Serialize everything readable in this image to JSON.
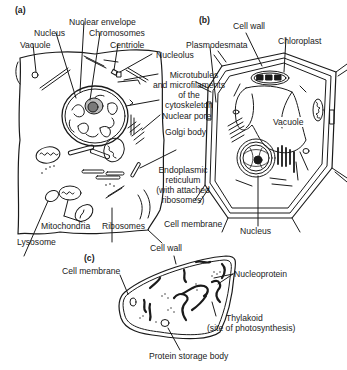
{
  "panels": {
    "a": "(a)",
    "b": "(b)",
    "c": "(c)"
  },
  "animal_cell": {
    "labels": {
      "vacuole": "Vacuole",
      "nucleus": "Nucleus",
      "nuclear_envelope": "Nuclear envelope",
      "chromosomes": "Chromosomes",
      "centriole": "Centriole",
      "nucleolus": "Nucleolus",
      "cytoskeleton_1": "Microtubules",
      "cytoskeleton_2": "and microfilaments",
      "cytoskeleton_3": "of the",
      "cytoskeleton_4": "cytoskeleton",
      "nuclear_pore": "Nuclear pore",
      "golgi_body": "Golgi body",
      "er_1": "Endoplasmic",
      "er_2": "reticulum",
      "er_3": "(with attached",
      "er_4": "ribosomes)",
      "cell_membrane": "Cell membrane",
      "mitochondria": "Mitochondria",
      "ribosomes": "Ribosomes",
      "lysosome": "Lysosome"
    }
  },
  "plant_cell": {
    "labels": {
      "cell_wall": "Cell wall",
      "plasmodesmata": "Plasmodesmata",
      "chloroplast": "Chloroplast",
      "vacuole": "Vacuole",
      "nucleus": "Nucleus"
    }
  },
  "bacterial_cell": {
    "labels": {
      "cell_wall": "Cell wall",
      "cell_membrane": "Cell membrane",
      "nucleoprotein": "Nucleoprotein",
      "thylakoid_1": "Thylakoid",
      "thylakoid_2": "(site of photosynthesis)",
      "protein_storage_body": "Protein storage body"
    }
  },
  "colors": {
    "line": "#1a1a1a",
    "nucleolus_fill": "#8a8a8a",
    "background": "#ffffff"
  }
}
